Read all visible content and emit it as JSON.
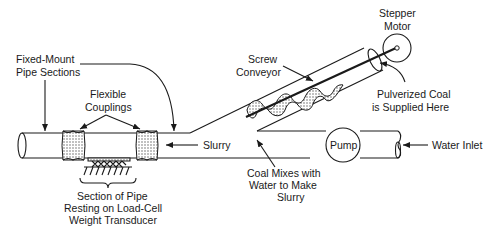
{
  "diagram": {
    "type": "coal slurry mixing system schematic",
    "labels": {
      "fixed_mount_1": "Fixed-Mount",
      "fixed_mount_2": "Pipe Sections",
      "flexible_1": "Flexible",
      "flexible_2": "Couplings",
      "screw_1": "Screw",
      "screw_2": "Conveyor",
      "stepper_1": "Stepper",
      "stepper_2": "Motor",
      "coal_supply_1": "Pulverized Coal",
      "coal_supply_2": "is Supplied Here",
      "slurry": "Slurry",
      "pump": "Pump",
      "water_inlet": "Water Inlet",
      "mix_1": "Coal Mixes with",
      "mix_2": "Water to Make",
      "mix_3": "Slurry",
      "section_1": "Section of Pipe",
      "section_2": "Resting on Load-Cell",
      "section_3": "Weight Transducer"
    },
    "components": [
      "fixed-mount pipe sections",
      "flexible couplings",
      "load-cell weight transducer",
      "screw conveyor",
      "stepper motor",
      "pump",
      "water inlet"
    ],
    "colors": {
      "line": "#1a1a1a",
      "background": "#ffffff"
    }
  }
}
